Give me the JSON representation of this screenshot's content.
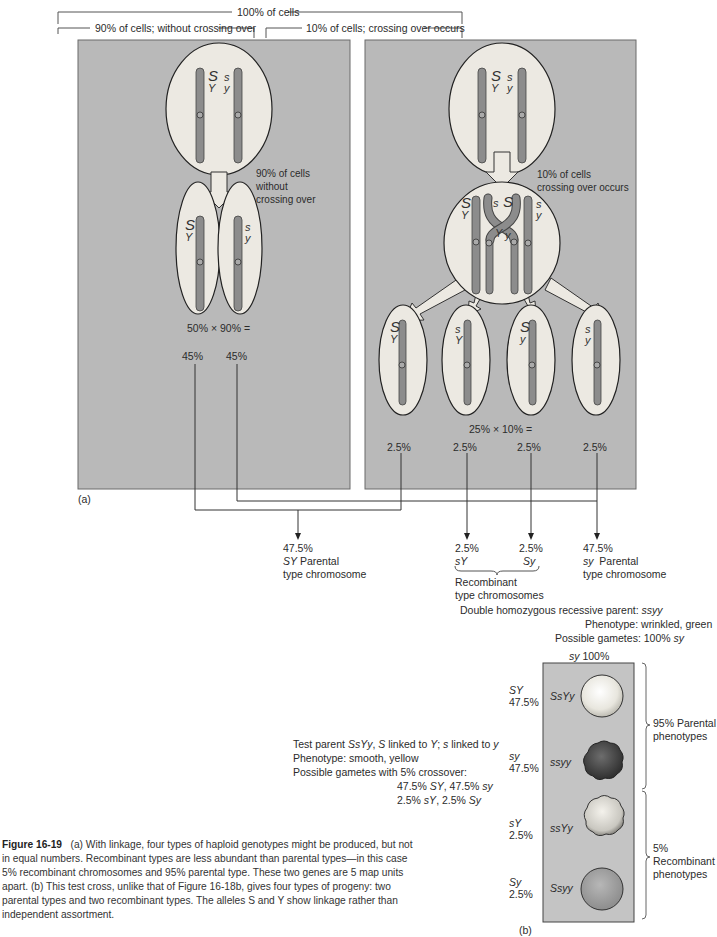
{
  "brackets": {
    "top": "100% of cells",
    "left": "90% of cells; without crossing over",
    "right": "10% of cells; crossing over occurs"
  },
  "panel_a": {
    "label": "(a)",
    "no_crossover": {
      "parent_alleles": [
        {
          "upper": "S",
          "lower": "Y"
        },
        {
          "upper": "s",
          "lower": "y"
        }
      ],
      "arrow_note": [
        "90% of cells",
        "without",
        "crossing over"
      ],
      "gametes": [
        {
          "upper": "S",
          "lower": "Y"
        },
        {
          "upper": "s",
          "lower": "y"
        }
      ],
      "calculation": "50% × 90% =",
      "percents": [
        "45%",
        "45%"
      ]
    },
    "crossover": {
      "parent_alleles": [
        {
          "upper": "S",
          "lower": "Y"
        },
        {
          "upper": "s",
          "lower": "y"
        }
      ],
      "arrow_note": [
        "10% of cells",
        "crossing over occurs"
      ],
      "tetrad_alleles": {
        "left": [
          "S",
          "Y"
        ],
        "cross_top": [
          "s",
          "S"
        ],
        "cross_bottom": [
          "Y",
          "y"
        ],
        "right": [
          "s",
          "y"
        ]
      },
      "gametes": [
        {
          "upper": "S",
          "lower": "Y"
        },
        {
          "upper": "s",
          "lower": "Y"
        },
        {
          "upper": "S",
          "lower": "y"
        },
        {
          "upper": "s",
          "lower": "y"
        }
      ],
      "calculation": "25% × 10% =",
      "percents": [
        "2.5%",
        "2.5%",
        "2.5%",
        "2.5%"
      ]
    }
  },
  "totals": [
    {
      "percent": "47.5%",
      "genotype": "SY",
      "label": "Parental",
      "sub": "type chromosome"
    },
    {
      "percent": "2.5%",
      "genotype": "sY"
    },
    {
      "percent": "2.5%",
      "genotype": "Sy"
    },
    {
      "percent": "47.5%",
      "genotype": "sy",
      "label": "Parental",
      "sub": "type chromosome"
    }
  ],
  "recombinant_label": [
    "Recombinant",
    "type chromosomes"
  ],
  "panel_b": {
    "label": "(b)",
    "double_recessive": {
      "parent_prefix": "Double homozygous recessive parent: ",
      "parent_genotype": "ssyy",
      "phenotype": "Phenotype: wrinkled, green",
      "gametes_prefix": "Possible gametes: 100% ",
      "gametes_genotype": "sy"
    },
    "plate_header_genotype": "sy",
    "plate_header_percent": " 100%",
    "test_parent": {
      "line1_prefix": "Test parent ",
      "line1_genotype": "SsYy",
      "line1_rest_a": ", ",
      "S": "S",
      "linked1": " linked to ",
      "Y": "Y",
      "semicolon": "; ",
      "s": "s",
      "linked2": " linked to ",
      "y": "y",
      "phenotype": "Phenotype: smooth, yellow",
      "gametes_title": "Possible gametes with 5% crossover:",
      "gametes_line1": [
        "47.5% ",
        "SY",
        ", 47.5% ",
        "sy"
      ],
      "gametes_line2": [
        "2.5% ",
        "sY",
        ", 2.5% ",
        "Sy"
      ]
    },
    "progeny": [
      {
        "gamete": "SY",
        "percent": "47.5%",
        "genotype": "SsYy",
        "seed": "smooth-yellow"
      },
      {
        "gamete": "sy",
        "percent": "47.5%",
        "genotype": "ssyy",
        "seed": "wrinkled-green"
      },
      {
        "gamete": "sY",
        "percent": "2.5%",
        "genotype": "ssYy",
        "seed": "wrinkled-yellow"
      },
      {
        "gamete": "Sy",
        "percent": "2.5%",
        "genotype": "Ssyy",
        "seed": "smooth-green"
      }
    ],
    "groups": [
      {
        "lines": [
          "95% Parental",
          "phenotypes"
        ]
      },
      {
        "lines": [
          "5%",
          "Recombinant",
          "phenotypes"
        ]
      }
    ]
  },
  "caption": {
    "figure": "Figure 16-19",
    "text": "(a) With linkage, four types of haploid genotypes might be produced, but not in equal numbers. Recombinant types are less abundant than parental types—in this case 5% recombinant chromosomes and 95% parental type. These two genes are 5 map units apart. (b) This test cross, unlike that of Figure 16-18b, gives four types of progeny: two parental types and two recombinant types. The alleles S and Y show linkage rather than independent assortment."
  },
  "colors": {
    "panel_bg": "#b9b9b9",
    "cell_fill": "#ece9e2",
    "chromosome": "#8c8c8c",
    "plate_bg": "#c4c4c4",
    "line": "#3a3a3a"
  }
}
